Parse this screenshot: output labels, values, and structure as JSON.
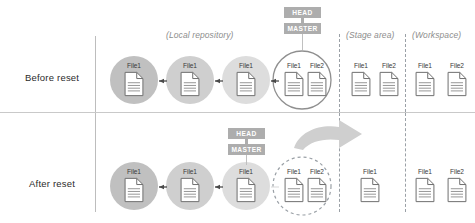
{
  "diagram": {
    "colors": {
      "commit_fill": "#c4c4c4",
      "commit_outline": "#8f8f8f",
      "tag_bg": "#adadad",
      "tag_text": "#ffffff",
      "caption_text": "#8d8d8d",
      "arrow": "#4a4a4a",
      "big_arrow": "#c9c9c9",
      "divider": "#c9c9c9",
      "dashed_divider": "#9aa0a6"
    },
    "captions": {
      "local_repository": "(Local repository)",
      "stage_area": "(Stage area)",
      "workspace": "(Workspace)"
    },
    "tags": {
      "head": "HEAD",
      "master": "MASTER"
    },
    "rows": [
      {
        "id": "before",
        "label": "Before reset",
        "commits": [
          {
            "style": "filled",
            "files": [
              "File1"
            ]
          },
          {
            "style": "filled",
            "files": [
              "File1"
            ]
          },
          {
            "style": "filled",
            "files": [
              "File1"
            ]
          },
          {
            "style": "outline",
            "files": [
              "File1",
              "File2"
            ]
          }
        ],
        "stage_files": [
          "File1",
          "File2"
        ],
        "workspace_files": [
          "File1",
          "File2"
        ],
        "has_big_arrow": false
      },
      {
        "id": "after",
        "label": "After reset",
        "commits": [
          {
            "style": "filled",
            "files": [
              "File1"
            ]
          },
          {
            "style": "filled",
            "files": [
              "File1"
            ]
          },
          {
            "style": "filled",
            "files": [
              "File1"
            ]
          },
          {
            "style": "dashed",
            "files": [
              "File1",
              "File2"
            ]
          }
        ],
        "stage_files": [
          "File1"
        ],
        "workspace_files": [
          "File1",
          "File2"
        ],
        "has_big_arrow": true
      }
    ]
  }
}
